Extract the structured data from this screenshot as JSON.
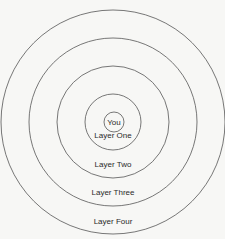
{
  "diagram": {
    "center": {
      "x": 113,
      "y": 122
    },
    "stroke_color": "#555555",
    "background": "#f7f7f5",
    "rings": [
      {
        "id": "you",
        "label": "You",
        "radius": 10,
        "label_y": 125
      },
      {
        "id": "layer-one",
        "label": "Layer One",
        "radius": 28,
        "label_y": 138
      },
      {
        "id": "layer-two",
        "label": "Layer Two",
        "radius": 56,
        "label_y": 167
      },
      {
        "id": "layer-three",
        "label": "Layer Three",
        "radius": 84,
        "label_y": 195
      },
      {
        "id": "layer-four",
        "label": "Layer Four",
        "radius": 112,
        "label_y": 224
      }
    ]
  }
}
